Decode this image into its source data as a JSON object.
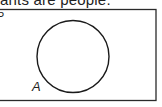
{
  "caption": "ants are people.",
  "diagram": {
    "type": "venn",
    "universal_set_label": "P",
    "sets": [
      {
        "label": "A"
      }
    ],
    "colors": {
      "stroke": "#1a1a1a",
      "background": "#ffffff"
    }
  }
}
